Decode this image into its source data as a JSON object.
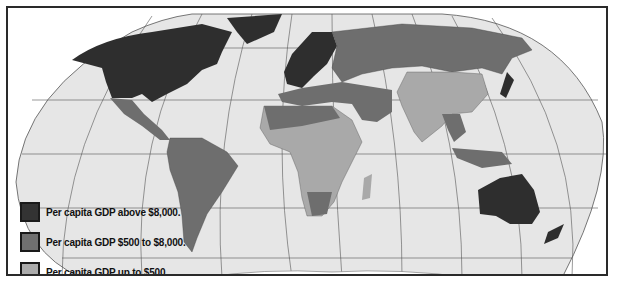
{
  "map": {
    "type": "choropleth world map",
    "projection": "Robinson-like",
    "colors": {
      "ocean": "#e6e6e6",
      "high": "#2e2e2e",
      "middle": "#6e6e6e",
      "low": "#a9a9a9",
      "graticule": "#555555",
      "frame": "#2a2a2a"
    }
  },
  "legend": {
    "items": [
      {
        "label": "Per capita GDP above $8,000.",
        "color": "#333333"
      },
      {
        "label": "Per capita GDP $500 to $8,000.",
        "color": "#707070"
      },
      {
        "label": "Per capita GDP up to $500.",
        "color": "#acacac"
      }
    ]
  }
}
